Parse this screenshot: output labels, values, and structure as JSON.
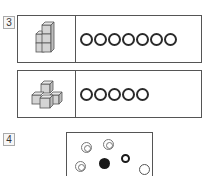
{
  "question3": {
    "number": "3",
    "rows": [
      {
        "picture": "cube-stack-tower",
        "ring_count": 7,
        "rings": [
          "O",
          "O",
          "O",
          "O",
          "O",
          "O",
          "O"
        ]
      },
      {
        "picture": "cube-stack-cross",
        "ring_count": 5,
        "rings": [
          "O",
          "O",
          "O",
          "O",
          "O"
        ]
      }
    ]
  },
  "question4": {
    "number": "4",
    "circles": [
      {
        "type": "double-ring",
        "x": 14,
        "y": 9
      },
      {
        "type": "double-ring",
        "x": 36,
        "y": 6
      },
      {
        "type": "double-ring",
        "x": 8,
        "y": 28
      },
      {
        "type": "solid-black",
        "x": 32,
        "y": 25
      },
      {
        "type": "thick-ring",
        "x": 54,
        "y": 21
      },
      {
        "type": "plain-ring",
        "x": 72,
        "y": 31
      }
    ]
  },
  "colors": {
    "line": "#555555",
    "cube_fill": "#d4d4d4",
    "ink": "#1a1a1a"
  }
}
